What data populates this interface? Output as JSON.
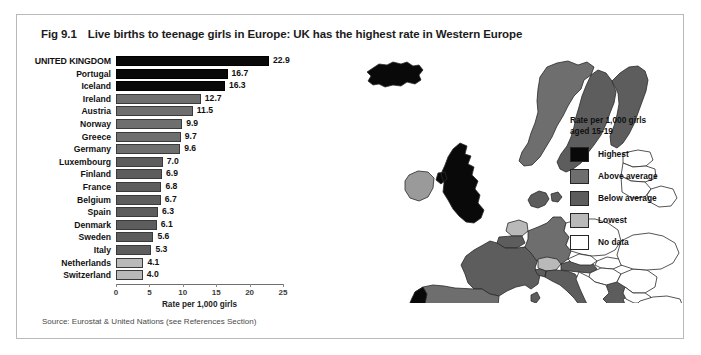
{
  "figure": {
    "number": "Fig 9.1",
    "title": "Live births to teenage girls in Europe:  UK has the highest rate in Western Europe",
    "source": "Source: Eurostat & United Nations (see References Section)"
  },
  "legend": {
    "title_line1": "Rate per 1,000 girls",
    "title_line2": "aged 15-19",
    "items": [
      {
        "key": "highest",
        "label": "Highest",
        "color": "#090909"
      },
      {
        "key": "above",
        "label": "Above average",
        "color": "#6e6e6e"
      },
      {
        "key": "below",
        "label": "Below average",
        "color": "#5d5d5d"
      },
      {
        "key": "lowest",
        "label": "Lowest",
        "color": "#b9b9b9"
      },
      {
        "key": "nodata",
        "label": "No data",
        "color": "#ffffff"
      }
    ]
  },
  "chart_data": {
    "type": "bar",
    "orientation": "horizontal",
    "title": "Live births to teenage girls in Europe:  UK has the highest rate in Western Europe",
    "xlabel": "Rate per 1,000 girls",
    "ylabel": "",
    "xlim": [
      0,
      25
    ],
    "xticks": [
      0,
      5,
      10,
      15,
      20,
      25
    ],
    "xticklabels": [
      "0",
      "5",
      "10",
      "15",
      "20",
      "25"
    ],
    "grid": false,
    "legend_position": "right",
    "categories": [
      "UNITED KINGDOM",
      "Portugal",
      "Iceland",
      "Ireland",
      "Austria",
      "Norway",
      "Greece",
      "Germany",
      "Luxembourg",
      "Finland",
      "France",
      "Belgium",
      "Spain",
      "Denmark",
      "Sweden",
      "Italy",
      "Netherlands",
      "Switzerland"
    ],
    "values": [
      22.9,
      16.7,
      16.3,
      12.7,
      11.5,
      9.9,
      9.7,
      9.6,
      7.0,
      6.9,
      6.8,
      6.7,
      6.3,
      6.1,
      5.6,
      5.3,
      4.1,
      4.0
    ],
    "value_labels": [
      "22.9",
      "16.7",
      "16.3",
      "12.7",
      "11.5",
      "9.9",
      "9.7",
      "9.6",
      "7.0",
      "6.9",
      "6.8",
      "6.7",
      "6.3",
      "6.1",
      "5.6",
      "5.3",
      "4.1",
      "4.0"
    ],
    "categories_class": [
      "highest",
      "highest",
      "highest",
      "above",
      "above",
      "above",
      "above",
      "above",
      "below",
      "below",
      "below",
      "below",
      "below",
      "below",
      "below",
      "below",
      "lowest",
      "lowest"
    ]
  },
  "map": {
    "name": "europe-choropleth",
    "description": "Map of Europe shaded by teenage birth rate category"
  }
}
